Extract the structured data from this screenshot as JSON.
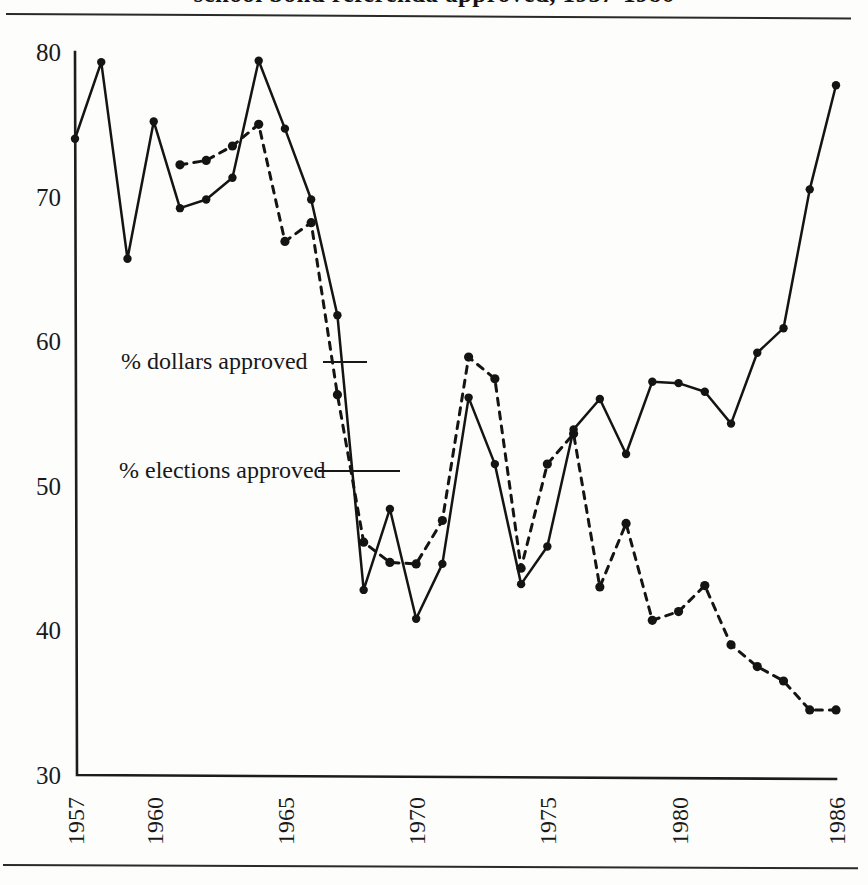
{
  "figure": {
    "title_partial": "school bond referenda approved, 1957-1986",
    "title_visible_note": "cropped at top edge",
    "y_axis_label": "",
    "x_axis_label": ""
  },
  "annotations": [
    {
      "id": "dollars",
      "label": "% dollars approved"
    },
    {
      "id": "elections",
      "label": "% elections approved"
    }
  ],
  "axis": {
    "y_ticks": [
      "80",
      "70",
      "60",
      "50",
      "40",
      "30"
    ],
    "x_ticks": [
      "1957",
      "1960",
      "1965",
      "1970",
      "1975",
      "1980",
      "1986"
    ]
  },
  "colors": {
    "ink": "#141414",
    "paper": "#fdfdfc",
    "rule": "#2a2a2a"
  },
  "chart_data": {
    "type": "line",
    "xlabel": "",
    "ylabel": "percent approved",
    "xlim": [
      1957,
      1986
    ],
    "ylim": [
      30,
      80
    ],
    "y_ticks": [
      30,
      40,
      50,
      60,
      70,
      80
    ],
    "x_ticks": [
      1957,
      1960,
      1965,
      1970,
      1975,
      1980,
      1986
    ],
    "grid": false,
    "legend": "inline annotations with leader lines",
    "x": [
      1957,
      1958,
      1959,
      1960,
      1961,
      1962,
      1963,
      1964,
      1965,
      1966,
      1967,
      1968,
      1969,
      1970,
      1971,
      1972,
      1973,
      1974,
      1975,
      1976,
      1977,
      1978,
      1979,
      1980,
      1981,
      1982,
      1983,
      1984,
      1985,
      1986
    ],
    "series": [
      {
        "name": "% dollars approved",
        "style": "solid",
        "x": [
          1957,
          1958,
          1959,
          1960,
          1961,
          1962,
          1963,
          1964,
          1965,
          1966,
          1967,
          1968,
          1969,
          1970,
          1971,
          1972,
          1973,
          1974,
          1975,
          1976,
          1977,
          1978,
          1979,
          1980,
          1981,
          1982,
          1983,
          1984,
          1985,
          1986
        ],
        "values": [
          74.0,
          79.3,
          65.7,
          75.2,
          69.2,
          69.8,
          71.3,
          79.4,
          74.7,
          69.8,
          61.8,
          42.8,
          48.4,
          40.8,
          44.6,
          56.1,
          51.5,
          43.2,
          45.8,
          53.9,
          56.0,
          52.2,
          57.2,
          57.1,
          56.5,
          54.3,
          59.2,
          60.9,
          70.5,
          77.7
        ]
      },
      {
        "name": "% elections approved",
        "style": "dashed",
        "x": [
          1961,
          1962,
          1963,
          1964,
          1965,
          1966,
          1967,
          1968,
          1969,
          1970,
          1971,
          1972,
          1973,
          1974,
          1975,
          1976,
          1977,
          1978,
          1979,
          1980,
          1981,
          1982,
          1983,
          1984,
          1985,
          1986
        ],
        "values": [
          72.2,
          72.5,
          73.5,
          75.0,
          66.9,
          68.2,
          56.3,
          46.1,
          44.7,
          44.6,
          47.6,
          58.9,
          57.4,
          44.3,
          51.5,
          53.6,
          43.0,
          47.4,
          40.7,
          41.3,
          43.1,
          39.0,
          37.5,
          36.5,
          34.5,
          34.5
        ]
      }
    ]
  }
}
